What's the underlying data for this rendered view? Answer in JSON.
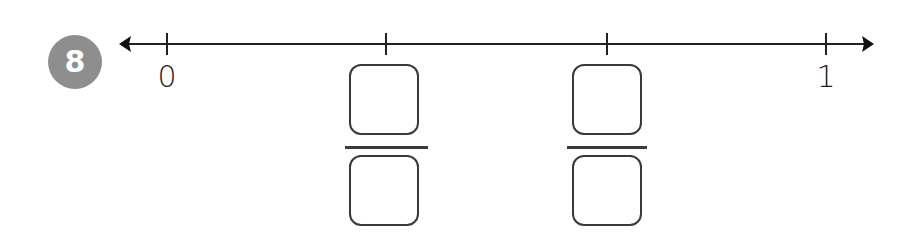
{
  "problem": {
    "number": "8",
    "badge_color": "#8e8e8e"
  },
  "number_line": {
    "line_color": "#222222",
    "start_label": "0",
    "end_label": "1",
    "ticks": [
      {
        "position": 0,
        "label": "0"
      },
      {
        "position": 1,
        "label": "blank-fraction"
      },
      {
        "position": 2,
        "label": "blank-fraction"
      },
      {
        "position": 3,
        "label": "1"
      }
    ]
  },
  "answer_fractions": [
    {
      "numerator": "",
      "denominator": ""
    },
    {
      "numerator": "",
      "denominator": ""
    }
  ]
}
